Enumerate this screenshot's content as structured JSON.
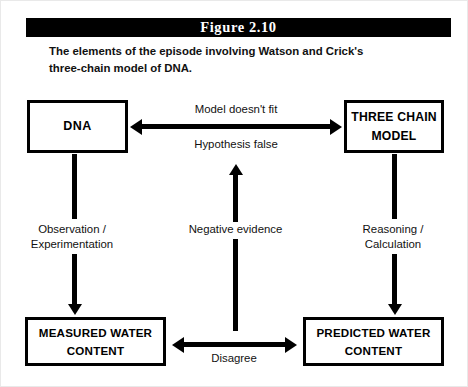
{
  "figure": {
    "number_label": "Figure 2.10",
    "caption_line1": "The elements of the episode involving Watson and Crick's",
    "caption_line2": "three-chain model of DNA.",
    "colors": {
      "bar": "#000000",
      "ink": "#000000",
      "page": "#ffffff"
    }
  },
  "nodes": {
    "dna": {
      "label": "DNA"
    },
    "three_chain_model": {
      "line1": "THREE CHAIN",
      "line2": "MODEL"
    },
    "measured_water_content": {
      "line1": "MEASURED WATER",
      "line2": "CONTENT"
    },
    "predicted_water_content": {
      "line1": "PREDICTED WATER",
      "line2": "CONTENT"
    }
  },
  "edges": {
    "top_above": "Model doesn't fit",
    "top_below": "Hypothesis false",
    "left_line1": "Observation /",
    "left_line2": "Experimentation",
    "center_label": "Negative evidence",
    "right_line1": "Reasoning /",
    "right_line2": "Calculation",
    "bottom_label": "Disagree"
  }
}
